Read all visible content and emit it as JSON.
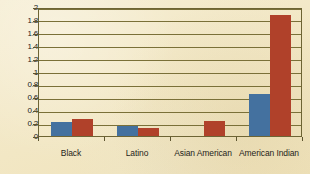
{
  "chart_data": {
    "type": "bar",
    "title": "",
    "subtitle": "",
    "xlabel": "",
    "ylabel": "",
    "categories": [
      "Black",
      "Latino",
      "Asian American",
      "American Indian"
    ],
    "series": [
      {
        "name": "series-blue",
        "color": "#44719f",
        "values": [
          0.22,
          0.15,
          0,
          0.65
        ]
      },
      {
        "name": "series-red",
        "color": "#b0412a",
        "values": [
          0.27,
          0.13,
          0.23,
          1.87
        ]
      }
    ],
    "ylim": [
      0,
      2
    ],
    "ytick_labels": [
      "0",
      "0.2",
      "0.4",
      "0.6",
      "0.8",
      "1",
      "1.2",
      "1.4",
      "1.6",
      "1.8",
      "2"
    ],
    "ytick_values": [
      0,
      0.2,
      0.4,
      0.6,
      0.8,
      1,
      1.2,
      1.4,
      1.6,
      1.8,
      2
    ],
    "grid": true,
    "legend": "none",
    "background_color": "#f4ead0",
    "axis_color": "#6d6434",
    "gridline_color": "#7a7038"
  }
}
